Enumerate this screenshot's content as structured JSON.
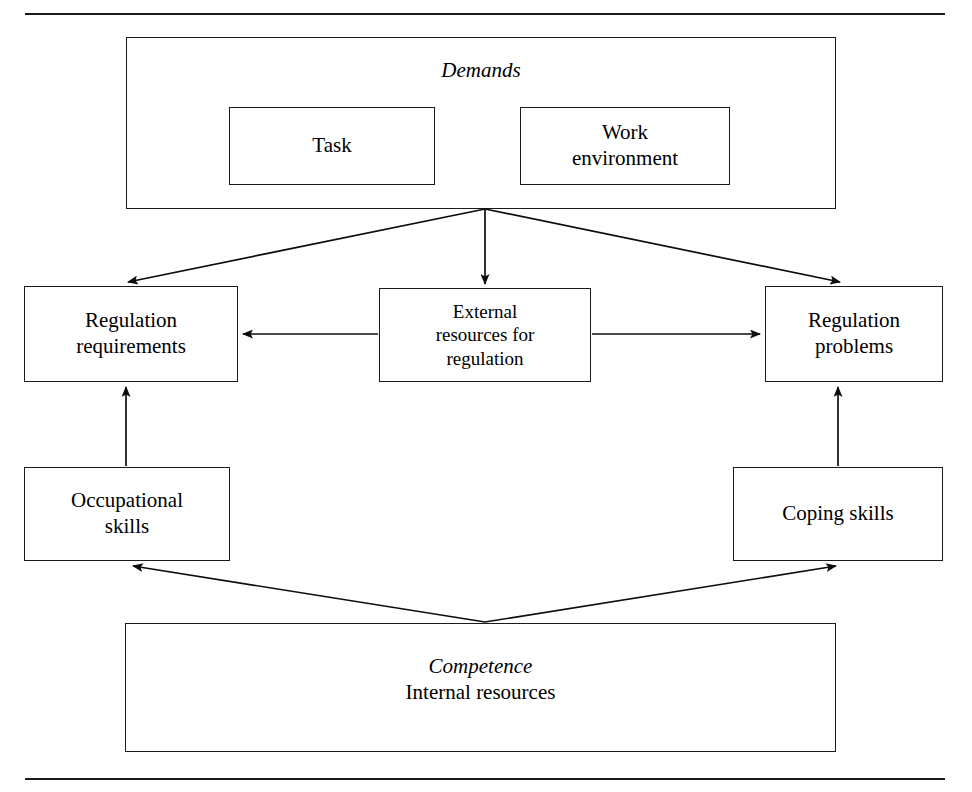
{
  "diagram": {
    "title_visible": false,
    "line_color": "#1a1a1a",
    "background": "#ffffff",
    "rules": {
      "top_rule": "",
      "bottom_rule": ""
    },
    "demands": {
      "title": "Demands",
      "children": [
        {
          "label": "Task"
        },
        {
          "label": "Work\nenvironment"
        }
      ],
      "child_task_label": "Task",
      "child_work_line1": "Work",
      "child_work_line2": "environment"
    },
    "middle": {
      "regulation_requirements_line1": "Regulation",
      "regulation_requirements_line2": "requirements",
      "external_resources_line1": "External",
      "external_resources_line2": "resources for",
      "external_resources_line3": "regulation",
      "regulation_problems_line1": "Regulation",
      "regulation_problems_line2": "problems"
    },
    "skills": {
      "occupational_line1": "Occupational",
      "occupational_line2": "skills",
      "coping_label": "Coping skills"
    },
    "competence": {
      "title": "Competence",
      "subtitle": "Internal resources"
    },
    "connections": [
      {
        "from": "Demands",
        "to": "Regulation requirements",
        "style": "arrow"
      },
      {
        "from": "Demands",
        "to": "External resources for regulation",
        "style": "arrow"
      },
      {
        "from": "Demands",
        "to": "Regulation problems",
        "style": "arrow"
      },
      {
        "from": "External resources for regulation",
        "to": "Regulation requirements",
        "style": "arrow"
      },
      {
        "from": "External resources for regulation",
        "to": "Regulation problems",
        "style": "arrow"
      },
      {
        "from": "Occupational skills",
        "to": "Regulation requirements",
        "style": "arrow"
      },
      {
        "from": "Coping skills",
        "to": "Regulation problems",
        "style": "arrow"
      },
      {
        "from": "Competence",
        "to": "Occupational skills",
        "style": "arrow"
      },
      {
        "from": "Competence",
        "to": "Coping skills",
        "style": "arrow"
      }
    ]
  }
}
